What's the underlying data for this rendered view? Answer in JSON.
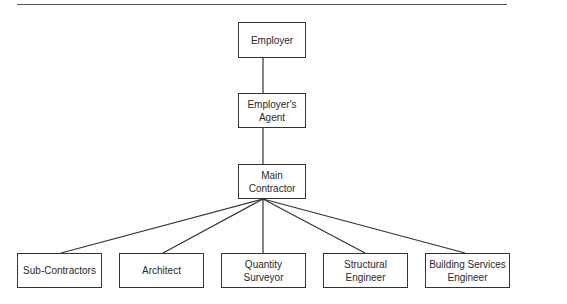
{
  "diagram": {
    "type": "organisation-chart",
    "nodes": {
      "employer": {
        "label": "Employer"
      },
      "agent": {
        "label": "Employer's\nAgent"
      },
      "main_contractor": {
        "label": "Main\nContractor"
      },
      "sub_contractors": {
        "label": "Sub-Contractors"
      },
      "architect": {
        "label": "Architect"
      },
      "quantity_surveyor": {
        "label": "Quantity\nSurveyor"
      },
      "structural_engineer": {
        "label": "Structural\nEngineer"
      },
      "building_services_engineer": {
        "label": "Building Services\nEngineer"
      }
    },
    "edges": [
      [
        "employer",
        "agent"
      ],
      [
        "agent",
        "main_contractor"
      ],
      [
        "main_contractor",
        "sub_contractors"
      ],
      [
        "main_contractor",
        "architect"
      ],
      [
        "main_contractor",
        "quantity_surveyor"
      ],
      [
        "main_contractor",
        "structural_engineer"
      ],
      [
        "main_contractor",
        "building_services_engineer"
      ]
    ],
    "colors": {
      "line": "#333333",
      "text": "#2a2a2a",
      "background": "#ffffff"
    }
  }
}
